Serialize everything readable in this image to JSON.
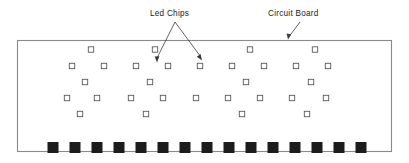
{
  "figure": {
    "background_color": "#ffffff",
    "width": 409,
    "height": 163
  },
  "labels": {
    "led_chips": "Led Chips",
    "circuit_board": "Circuit Board"
  },
  "colors": {
    "board_outline": "#8a8a8a",
    "chip_outline": "#5a5a5a",
    "chip_fill": "#ffffff",
    "pad_fill": "#1c1c1c",
    "leader_line": "#3a3a3a",
    "text": "#1a1a1a"
  },
  "board": {
    "x": 17,
    "y": 40,
    "width": 375,
    "height": 112
  },
  "chip_size": 5.4,
  "chip_rows": [
    {
      "row": 1,
      "y": 49.5,
      "count": 4,
      "x_positions": [
        91,
        155,
        250,
        315
      ]
    },
    {
      "row": 2,
      "y": 66.0,
      "count": 8,
      "x_positions": [
        72,
        104,
        136,
        168,
        200,
        232,
        264,
        296
      ]
    },
    {
      "row": 3,
      "y": 82.0,
      "count": 4,
      "x_positions": [
        85,
        150,
        246,
        311
      ]
    },
    {
      "row": 4,
      "y": 98.0,
      "count": 9,
      "x_positions": [
        67,
        97,
        131,
        163,
        196,
        228,
        260,
        292,
        326
      ]
    },
    {
      "row": 5,
      "y": 114.0,
      "count": 4,
      "x_positions": [
        80,
        146,
        242,
        307
      ]
    }
  ],
  "chip_rows_extra": {
    "row2_tail": [
      328
    ],
    "row4_note": "alternating offset lattice"
  },
  "pads": {
    "count": 16,
    "y": 142,
    "width": 11,
    "height": 11,
    "x_positions": [
      53,
      75,
      97,
      119,
      141,
      163,
      185,
      207,
      229,
      251,
      273,
      295,
      317,
      339,
      361
    ]
  },
  "leaders": {
    "led_chips": {
      "origin": {
        "x": 175,
        "y": 22
      },
      "targets": [
        {
          "x": 157,
          "y": 62
        },
        {
          "x": 201,
          "y": 60
        }
      ]
    },
    "circuit_board": {
      "origin": {
        "x": 300,
        "y": 22
      },
      "target": {
        "x": 288,
        "y": 39
      }
    }
  },
  "text_positions": {
    "led_chips": {
      "x": 150,
      "y": 16
    },
    "circuit_board": {
      "x": 268,
      "y": 16
    }
  }
}
